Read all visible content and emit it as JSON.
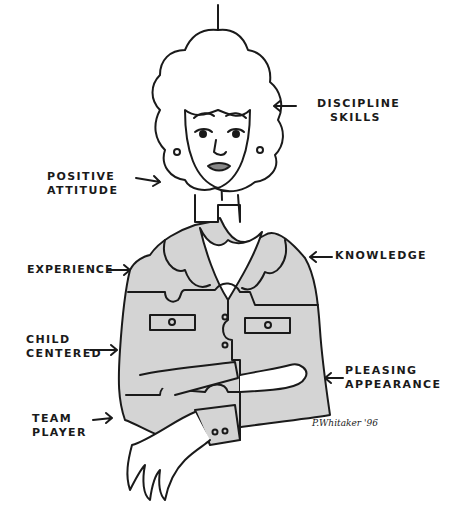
{
  "illustration": {
    "subject": "woman drawn as interlocking puzzle pieces",
    "colors": {
      "ink": "#1a1a1a",
      "jacket_fill": "#d4d4d4",
      "background": "#ffffff",
      "skin": "#ffffff"
    }
  },
  "labels": {
    "discipline": {
      "line1": "DISCIPLINE",
      "line2": "SKILLS"
    },
    "positive": {
      "line1": "POSITIVE",
      "line2": "ATTITUDE"
    },
    "experience": {
      "line1": "EXPERIENCE"
    },
    "knowledge": {
      "line1": "KNOWLEDGE"
    },
    "child": {
      "line1": "CHILD",
      "line2": "CENTERED"
    },
    "pleasing": {
      "line1": "PLEASING",
      "line2": "APPEARANCE"
    },
    "team": {
      "line1": "TEAM",
      "line2": "PLAYER"
    }
  },
  "signature": "P.Whitaker '96"
}
